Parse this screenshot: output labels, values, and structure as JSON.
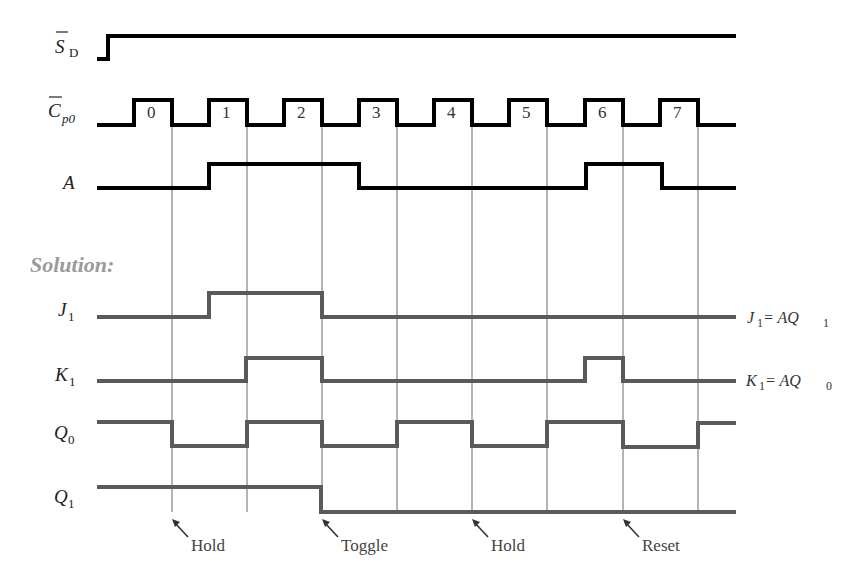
{
  "diagram": {
    "type": "timing-diagram",
    "solution_label": "Solution:",
    "colors": {
      "input_signals": "#000000",
      "solution_signals": "#5a5a5a",
      "solution_label": "#9a9a9a",
      "grid_lines": "#444444"
    },
    "clock": {
      "name": "Cp0 (overbar)",
      "pulse_labels": [
        "0",
        "1",
        "2",
        "3",
        "4",
        "5",
        "6",
        "7"
      ],
      "falling_edges_x": [
        172,
        247,
        322,
        397,
        472,
        547,
        623,
        698
      ]
    },
    "signals": [
      {
        "id": "SD",
        "label_main": "S",
        "label_sub": "D",
        "overbar": true,
        "group": "input",
        "levels": "0 then 1 for remainder"
      },
      {
        "id": "Cp0",
        "label_main": "C",
        "label_sub": "p0",
        "overbar": true,
        "group": "input",
        "levels": "8 clock pulses"
      },
      {
        "id": "A",
        "label_main": "A",
        "label_sub": "",
        "overbar": false,
        "group": "input",
        "levels": "high during pulses 1-3 start, and pulse 6"
      },
      {
        "id": "J1",
        "label_main": "J",
        "label_sub": "1",
        "group": "solution",
        "equation": "J1 = AQ1"
      },
      {
        "id": "K1",
        "label_main": "K",
        "label_sub": "1",
        "group": "solution",
        "equation": "K1 = AQ0"
      },
      {
        "id": "Q0",
        "label_main": "Q",
        "label_sub": "0",
        "group": "solution"
      },
      {
        "id": "Q1",
        "label_main": "Q",
        "label_sub": "1",
        "group": "solution"
      }
    ],
    "equations": {
      "j1": {
        "left": "J",
        "left_sub": "1",
        "eq": " = AQ",
        "right_sub": "1"
      },
      "k1": {
        "left": "K",
        "left_sub": "1",
        "eq": " = AQ",
        "right_sub": "0"
      }
    },
    "annotations": [
      {
        "text": "Hold",
        "edge": 0
      },
      {
        "text": "Toggle",
        "edge": 2
      },
      {
        "text": "Hold",
        "edge": 4
      },
      {
        "text": "Reset",
        "edge": 6
      }
    ]
  }
}
